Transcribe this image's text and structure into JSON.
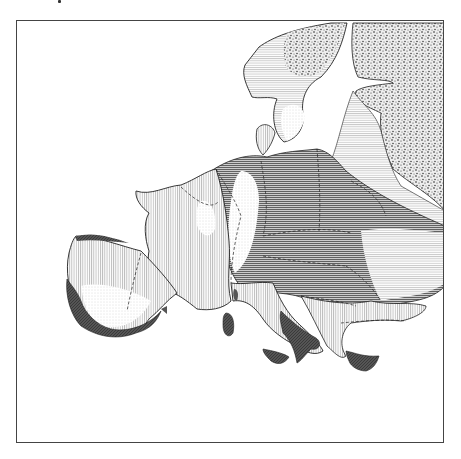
{
  "map": {
    "subject": "Europe",
    "style": "monochrome hatched thematic map",
    "labels": [],
    "colors": {
      "frame": "#444444",
      "coast": "#222222",
      "sea": "#ffffff",
      "dark_fill": "#555555"
    },
    "legend": {
      "categories": [
        {
          "pattern": "dense-dots",
          "description": "stippled region (Finland/Russia, northern Scandinavia)"
        },
        {
          "pattern": "horizontal-dark",
          "description": "dense horizontal hatching (Central/Eastern Europe)"
        },
        {
          "pattern": "horizontal-light",
          "description": "light horizontal hatching"
        },
        {
          "pattern": "vertical",
          "description": "vertical hatching (France, Iberia interior, Italy)"
        },
        {
          "pattern": "fine-dots",
          "description": "fine dotted light areas"
        },
        {
          "pattern": "solid-dark",
          "description": "dark coastal bands (Iberia, S. Italy, Sicily, Sardinia, Greece)"
        }
      ]
    }
  }
}
